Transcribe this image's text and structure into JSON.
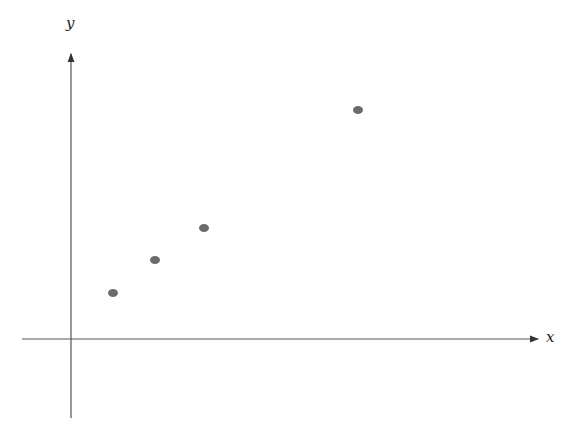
{
  "chart_data": {
    "type": "scatter",
    "title": "",
    "xlabel": "x",
    "ylabel": "y",
    "grid": false,
    "legend": null,
    "points": [
      {
        "px": 113,
        "py": 293
      },
      {
        "px": 155,
        "py": 260
      },
      {
        "px": 204,
        "py": 228
      },
      {
        "px": 358,
        "py": 110
      }
    ],
    "approx_values": {
      "x": [
        1.0,
        2.0,
        3.2,
        6.8
      ],
      "y": [
        1.1,
        1.9,
        2.6,
        5.4
      ]
    },
    "axis_ticks": "none",
    "point_color": "#6b6b6b",
    "axis_color": "#555555"
  },
  "axes": {
    "x_label": "x",
    "y_label": "y"
  }
}
